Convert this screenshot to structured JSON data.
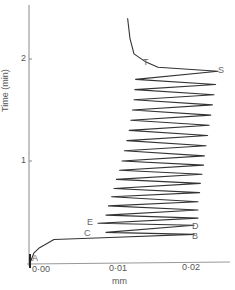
{
  "chart_data": {
    "type": "line",
    "title": "",
    "xlabel": "mm",
    "ylabel": "Time (min)",
    "xlim": [
      0.0,
      0.025
    ],
    "ylim": [
      0.0,
      2.5
    ],
    "x_ticks": [
      "0·00",
      "0·01",
      "0·02"
    ],
    "y_ticks": [
      "1",
      "2"
    ],
    "grid": false,
    "legend": null,
    "annotations": [
      {
        "label": "A",
        "x": 0.0,
        "y": 0.02
      },
      {
        "label": "B",
        "x": 0.0205,
        "y": 0.28
      },
      {
        "label": "C",
        "x": 0.0095,
        "y": 0.3
      },
      {
        "label": "D",
        "x": 0.0205,
        "y": 0.37
      },
      {
        "label": "E",
        "x": 0.0085,
        "y": 0.39
      },
      {
        "label": "S",
        "x": 0.0235,
        "y": 1.88
      },
      {
        "label": "T",
        "x": 0.0145,
        "y": 2.0
      }
    ],
    "series": [
      {
        "name": "trace",
        "description": "Initial rise A→B, then oscillating zigzag (≈22 cycles) between left edge (~0.009–0.013 mm) and right edge (~0.020–0.0235 mm) from B up to S (~1.88 min), then returns left to T and rises steeply near 0.012 mm to ~2.4 min.",
        "points": [
          [
            0.0,
            0.0
          ],
          [
            0.0005,
            0.1
          ],
          [
            0.0012,
            0.15
          ],
          [
            0.003,
            0.23
          ],
          [
            0.01,
            0.25
          ],
          [
            0.0205,
            0.28
          ],
          [
            0.0095,
            0.3
          ],
          [
            0.0205,
            0.37
          ],
          [
            0.0085,
            0.39
          ],
          [
            0.021,
            0.44
          ],
          [
            0.0095,
            0.47
          ],
          [
            0.021,
            0.52
          ],
          [
            0.0098,
            0.56
          ],
          [
            0.021,
            0.6
          ],
          [
            0.0102,
            0.65
          ],
          [
            0.0212,
            0.69
          ],
          [
            0.0105,
            0.73
          ],
          [
            0.0213,
            0.78
          ],
          [
            0.0108,
            0.82
          ],
          [
            0.0215,
            0.87
          ],
          [
            0.0112,
            0.91
          ],
          [
            0.0217,
            0.96
          ],
          [
            0.0115,
            1.0
          ],
          [
            0.0218,
            1.05
          ],
          [
            0.0118,
            1.1
          ],
          [
            0.022,
            1.15
          ],
          [
            0.0121,
            1.2
          ],
          [
            0.0222,
            1.25
          ],
          [
            0.0124,
            1.3
          ],
          [
            0.0224,
            1.35
          ],
          [
            0.0126,
            1.4
          ],
          [
            0.0226,
            1.45
          ],
          [
            0.0128,
            1.5
          ],
          [
            0.0228,
            1.55
          ],
          [
            0.013,
            1.6
          ],
          [
            0.023,
            1.65
          ],
          [
            0.0131,
            1.7
          ],
          [
            0.0232,
            1.75
          ],
          [
            0.0132,
            1.8
          ],
          [
            0.0235,
            1.88
          ],
          [
            0.016,
            1.92
          ],
          [
            0.0145,
            1.97
          ],
          [
            0.013,
            2.05
          ],
          [
            0.0125,
            2.2
          ],
          [
            0.0122,
            2.4
          ]
        ]
      }
    ]
  },
  "axes": {
    "x_tick_labels": [
      "0·00",
      "0·01",
      "0·02"
    ],
    "y_tick_labels": [
      "1",
      "2"
    ],
    "x_label": "mm",
    "y_label": "Time (min)"
  },
  "points": {
    "A": "A",
    "B": "B",
    "C": "C",
    "D": "D",
    "E": "E",
    "S": "S",
    "T": "T"
  }
}
